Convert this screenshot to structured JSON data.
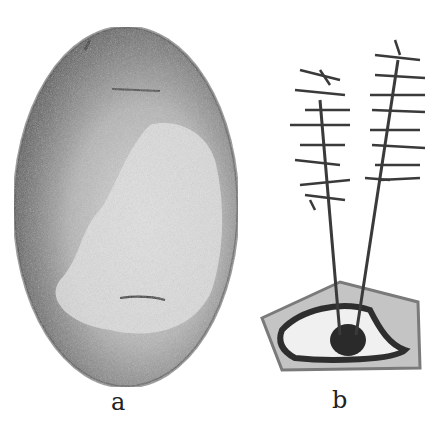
{
  "figure": {
    "panels": [
      {
        "id": "a",
        "label": "a",
        "description": "stippled egg-shaped stone with lighter patch"
      },
      {
        "id": "b",
        "label": "b",
        "description": "two spiky plant stalks rising from a pentagonal cell-like base"
      }
    ],
    "colors": {
      "background": "#ffffff",
      "stone_dark": "#555555",
      "stone_mid": "#8a8a8a",
      "stone_light": "#d8d8d8",
      "plant_dark": "#333333",
      "base_fill": "#bdbdbd"
    }
  }
}
